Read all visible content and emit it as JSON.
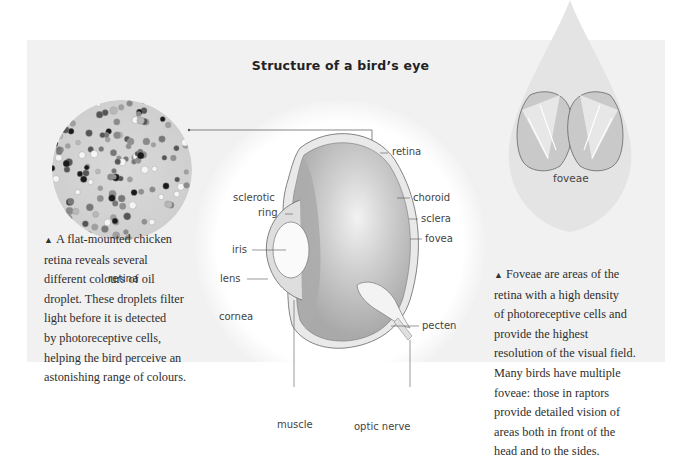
{
  "title": "Structure of a bird’s eye",
  "retina_inset": {
    "label": "retina",
    "caption_marker": "▲",
    "caption_lines": [
      "A flat-mounted chicken",
      "retina reveals several",
      "different colours of oil",
      "droplet. These droplets filter",
      "light before it is detected",
      "by photoreceptive cells,",
      "helping the bird perceive an",
      "astonishing range of colours."
    ]
  },
  "eye_diagram": {
    "labels": {
      "retina": "retina",
      "choroid": "choroid",
      "sclera": "sclera",
      "fovea": "fovea",
      "sclerotic": "sclerotic",
      "ring": "ring",
      "iris": "iris",
      "lens": "lens",
      "cornea": "cornea",
      "pecten": "pecten",
      "muscle": "muscle",
      "optic_nerve": "optic nerve"
    }
  },
  "foveae_inset": {
    "label": "foveae",
    "caption_marker": "▲",
    "caption_lines": [
      "Foveae are areas of the",
      "retina with a high density",
      "of photoreceptive cells and",
      "provide the highest",
      "resolution of the visual field.",
      "Many birds have multiple",
      "foveae: those in raptors",
      "provide detailed vision of",
      "areas both in front of the",
      "head and to the sides."
    ]
  },
  "colors": {
    "panel": "#f1f1f1",
    "eye_fill": "#bdbdbd",
    "head_silhouette": "#e6e6e6",
    "line": "#555555"
  }
}
